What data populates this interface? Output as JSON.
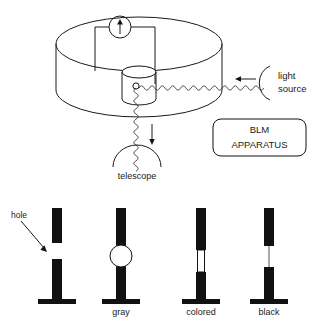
{
  "figure": {
    "background_color": "#ffffff",
    "ink_color": "#1a1a1a"
  },
  "apparatus": {
    "box_label_line1": "BLM",
    "box_label_line2": "APPARATUS",
    "light_source_label_line1": "light",
    "light_source_label_line2": "source",
    "telescope_label": "telescope",
    "meter_icon": "arrow-up-meter-icon",
    "light_beam_icon": "wavy-light-ray-icon",
    "incoming_arrow_icon": "arrow-left-icon",
    "outgoing_arrow_icon": "arrow-down-icon",
    "telescope_icon": "telescope-arc-icon",
    "chamber_icon": "cylindrical-chamber-icon",
    "inner_cell_icon": "inner-cylinder-cell-icon",
    "membrane_hole_icon": "membrane-hole-circle-icon"
  },
  "stages": {
    "hole_label": "hole",
    "hole_pointer_icon": "arrow-diagonal-icon",
    "items": [
      {
        "id": "stage-hole",
        "caption": "",
        "membrane_icon": "open-hole-icon"
      },
      {
        "id": "stage-gray",
        "caption": "gray",
        "membrane_icon": "thick-lens-droplet-icon"
      },
      {
        "id": "stage-colored",
        "caption": "colored",
        "membrane_icon": "thin-film-icon"
      },
      {
        "id": "stage-black",
        "caption": "black",
        "membrane_icon": "black-film-line-icon"
      }
    ]
  }
}
